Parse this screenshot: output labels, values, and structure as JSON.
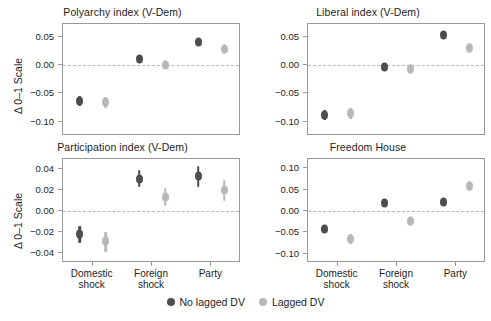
{
  "figure": {
    "y_axis_title": "Δ 0–1 Scale",
    "categories": [
      "Domestic\nshock",
      "Foreign\nshock",
      "Party"
    ],
    "category_labels": [
      {
        "line1": "Domestic",
        "line2": "shock"
      },
      {
        "line1": "Foreign",
        "line2": "shock"
      },
      {
        "line1": "Party",
        "line2": ""
      }
    ],
    "legend": {
      "items": [
        {
          "label": "No lagged DV",
          "color": "#4d4d4d"
        },
        {
          "label": "Lagged DV",
          "color": "#b8b8b8"
        }
      ]
    },
    "colors": {
      "no_lagged_dv": "#4d4d4d",
      "lagged_dv": "#b8b8b8",
      "zero_line": "#b9b9b9",
      "panel_border": "#9a9a9a",
      "text": "#1d1d1d",
      "background": "#ffffff"
    }
  },
  "chart_data": [
    {
      "type": "scatter",
      "title": "Polyarchy index (V-Dem)",
      "xlabel": "",
      "ylabel": "Δ 0–1 Scale",
      "categories": [
        "Domestic shock",
        "Foreign shock",
        "Party"
      ],
      "yticks": [
        0.05,
        0.0,
        -0.05,
        -0.1
      ],
      "ytick_labels": [
        "0.05",
        "0.00",
        "−0.05",
        "−0.10"
      ],
      "ylim": [
        -0.125,
        0.072
      ],
      "grid": false,
      "zero_reference_line": 0.0,
      "series": [
        {
          "name": "No lagged DV",
          "color": "#4d4d4d",
          "values": [
            -0.063,
            0.011,
            0.04
          ],
          "ci_low": [
            -0.072,
            0.004,
            0.033
          ],
          "ci_high": [
            -0.054,
            0.018,
            0.047
          ]
        },
        {
          "name": "Lagged DV",
          "color": "#b8b8b8",
          "values": [
            -0.066,
            0.0,
            0.028
          ],
          "ci_low": [
            -0.076,
            -0.008,
            0.02
          ],
          "ci_high": [
            -0.057,
            0.008,
            0.036
          ]
        }
      ]
    },
    {
      "type": "scatter",
      "title": "Liberal index (V-Dem)",
      "xlabel": "",
      "ylabel": "",
      "categories": [
        "Domestic shock",
        "Foreign shock",
        "Party"
      ],
      "yticks": [
        0.05,
        0.0,
        -0.05,
        -0.1
      ],
      "ytick_labels": [
        "0.05",
        "0.00",
        "−0.05",
        "−0.10"
      ],
      "ylim": [
        -0.125,
        0.072
      ],
      "grid": false,
      "zero_reference_line": 0.0,
      "series": [
        {
          "name": "No lagged DV",
          "color": "#4d4d4d",
          "values": [
            -0.088,
            -0.004,
            0.052
          ],
          "ci_low": [
            -0.097,
            -0.011,
            0.045
          ],
          "ci_high": [
            -0.079,
            0.003,
            0.059
          ]
        },
        {
          "name": "Lagged DV",
          "color": "#b8b8b8",
          "values": [
            -0.085,
            -0.007,
            0.029
          ],
          "ci_low": [
            -0.095,
            -0.016,
            0.021
          ],
          "ci_high": [
            -0.076,
            0.002,
            0.038
          ]
        }
      ]
    },
    {
      "type": "scatter",
      "title": "Participation index (V-Dem)",
      "xlabel": "",
      "ylabel": "Δ 0–1 Scale",
      "categories": [
        "Domestic shock",
        "Foreign shock",
        "Party"
      ],
      "yticks": [
        0.04,
        0.02,
        0.0,
        -0.02,
        -0.04
      ],
      "ytick_labels": [
        "0.04",
        "0.02",
        "0.00",
        "−0.02",
        "−0.04"
      ],
      "ylim": [
        -0.05,
        0.05
      ],
      "grid": false,
      "zero_reference_line": 0.0,
      "series": [
        {
          "name": "No lagged DV",
          "color": "#4d4d4d",
          "values": [
            -0.022,
            0.031,
            0.034
          ],
          "ci_low": [
            -0.031,
            0.023,
            0.023
          ],
          "ci_high": [
            -0.014,
            0.039,
            0.043
          ]
        },
        {
          "name": "Lagged DV",
          "color": "#b8b8b8",
          "values": [
            -0.029,
            0.013,
            0.02
          ],
          "ci_low": [
            -0.039,
            0.005,
            0.01
          ],
          "ci_high": [
            -0.02,
            0.022,
            0.03
          ]
        }
      ]
    },
    {
      "type": "scatter",
      "title": "Freedom House",
      "xlabel": "",
      "ylabel": "",
      "categories": [
        "Domestic shock",
        "Foreign shock",
        "Party"
      ],
      "yticks": [
        0.1,
        0.05,
        0.0,
        -0.05,
        -0.1
      ],
      "ytick_labels": [
        "0.10",
        "0.05",
        "0.00",
        "−0.05",
        "−0.10"
      ],
      "ylim": [
        -0.122,
        0.122
      ],
      "grid": false,
      "zero_reference_line": 0.0,
      "series": [
        {
          "name": "No lagged DV",
          "color": "#4d4d4d",
          "values": [
            -0.043,
            0.019,
            0.022
          ],
          "ci_low": [
            -0.052,
            0.011,
            0.013
          ],
          "ci_high": [
            -0.035,
            0.027,
            0.031
          ]
        },
        {
          "name": "Lagged DV",
          "color": "#b8b8b8",
          "values": [
            -0.066,
            -0.024,
            0.059
          ],
          "ci_low": [
            -0.077,
            -0.036,
            0.047
          ],
          "ci_high": [
            -0.055,
            -0.013,
            0.071
          ]
        }
      ]
    }
  ]
}
